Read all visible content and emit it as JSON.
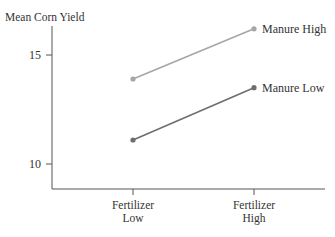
{
  "chart_data": {
    "type": "line",
    "title": "",
    "xlabel": "",
    "ylabel": "Mean Corn Yield",
    "categories": [
      "Fertilizer Low",
      "Fertilizer High"
    ],
    "category_lines": [
      [
        "Fertilizer",
        "Low"
      ],
      [
        "Fertilizer",
        "High"
      ]
    ],
    "yticks": [
      10,
      15
    ],
    "ylim": [
      8.8,
      17.5
    ],
    "grid": false,
    "legend_position": "inline-right",
    "series": [
      {
        "name": "Manure High",
        "values": [
          13.9,
          16.2
        ],
        "color": "#a6a6a6"
      },
      {
        "name": "Manure Low",
        "values": [
          11.1,
          13.5
        ],
        "color": "#6e6e6e"
      }
    ]
  }
}
